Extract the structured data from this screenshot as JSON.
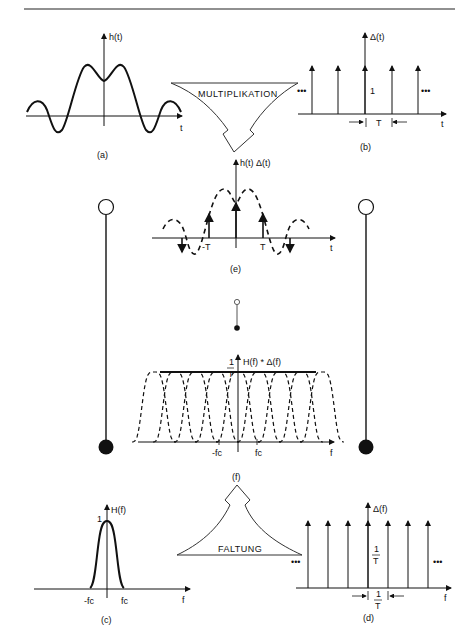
{
  "panels": {
    "a": {
      "caption": "(a)",
      "axis_label": "h(t)",
      "x_label": "t"
    },
    "b": {
      "caption": "(b)",
      "axis_label": "Δ(t)",
      "x_label": "t",
      "height_label": "1",
      "spacing_label": "T",
      "ellipsis": "•••"
    },
    "e": {
      "caption": "(e)",
      "axis_label": "h(t) Δ(t)",
      "x_label": "t",
      "left_tick": "-T",
      "right_tick": "T"
    },
    "f": {
      "caption": "(f)",
      "axis_label": "H(f) * Δ(f)",
      "x_label": "f",
      "height_num": "1",
      "height_den": "T",
      "left_tick": "-fc",
      "right_tick": "fc"
    },
    "c": {
      "caption": "(c)",
      "axis_label": "H(f)",
      "x_label": "f",
      "height_label": "1",
      "left_tick": "-fc",
      "right_tick": "fc"
    },
    "d": {
      "caption": "(d)",
      "axis_label": "Δ(f)",
      "x_label": "f",
      "height_num": "1",
      "height_den": "T",
      "spacing_num": "1",
      "spacing_den": "T",
      "ellipsis": "•••"
    }
  },
  "arrows": {
    "top": {
      "label": "MULTIPLIKATION"
    },
    "bottom": {
      "label": "FALTUNG"
    }
  },
  "fourier_pairs": [
    {
      "name": "left",
      "top": "open-circle",
      "bottom": "filled-circle"
    },
    {
      "name": "center",
      "top": "open-circle",
      "bottom": "filled-circle"
    },
    {
      "name": "right",
      "top": "open-circle",
      "bottom": "filled-circle"
    }
  ]
}
